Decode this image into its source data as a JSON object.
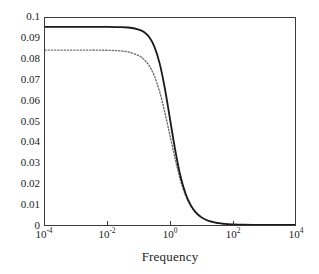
{
  "chart_data": {
    "type": "line",
    "title": "",
    "subtitle": "",
    "xlabel": "Frequency",
    "ylabel": "",
    "xscale": "log",
    "yscale": "linear",
    "xlim": [
      0.0001,
      10000
    ],
    "ylim": [
      0,
      0.1
    ],
    "grid": false,
    "legend": "none",
    "background_color": "#ffffff",
    "axis_color": "#3a3a3a",
    "x_tick_labels": [
      "10-4",
      "10-2",
      "100",
      "102",
      "104"
    ],
    "x_tick_values": [
      0.0001,
      0.01,
      1,
      100,
      10000
    ],
    "x_tick_mantissa": [
      "10",
      "10",
      "10",
      "10",
      "10"
    ],
    "x_tick_exponent": [
      "-4",
      "-2",
      "0",
      "2",
      "4"
    ],
    "y_tick_labels": [
      "0",
      "0.01",
      "0.02",
      "0.03",
      "0.04",
      "0.05",
      "0.06",
      "0.07",
      "0.08",
      "0.09",
      "0.1"
    ],
    "y_tick_values": [
      0,
      0.01,
      0.02,
      0.03,
      0.04,
      0.05,
      0.06,
      0.07,
      0.08,
      0.09,
      0.1
    ],
    "series": [
      {
        "name": "solid-curve",
        "style": "solid",
        "color": "#1a1a1a",
        "width": 1.8,
        "plateau_value": 0.0957,
        "knee_frequency": 0.2,
        "x": [
          0.0001,
          0.000215,
          0.000464,
          0.001,
          0.00215,
          0.00464,
          0.01,
          0.0215,
          0.0464,
          0.1,
          0.147,
          0.215,
          0.316,
          0.464,
          0.681,
          1.0,
          1.47,
          2.15,
          3.16,
          4.64,
          6.81,
          10.0,
          14.7,
          21.5,
          31.6,
          46.4,
          68.1,
          100.0,
          215.0,
          464.0,
          1000.0,
          2150.0,
          4640.0,
          10000.0
        ],
        "y": [
          0.0957,
          0.0957,
          0.0957,
          0.0957,
          0.0957,
          0.0957,
          0.0957,
          0.0956,
          0.0954,
          0.0944,
          0.0932,
          0.0908,
          0.0862,
          0.0782,
          0.0662,
          0.0512,
          0.0362,
          0.0238,
          0.0151,
          0.0095,
          0.006,
          0.0038,
          0.0024,
          0.0016,
          0.001,
          0.00068,
          0.00044,
          0.00029,
          0.00013,
          6e-05,
          3e-05,
          1.3e-05,
          6e-06,
          3e-06
        ]
      },
      {
        "name": "dotted-curve",
        "style": "dotted",
        "color": "#6e6e6e",
        "width": 1.4,
        "plateau_value": 0.0845,
        "knee_frequency": 0.15,
        "x": [
          0.0001,
          0.000215,
          0.000464,
          0.001,
          0.00215,
          0.00464,
          0.01,
          0.0215,
          0.0464,
          0.1,
          0.147,
          0.215,
          0.316,
          0.464,
          0.681,
          1.0,
          1.47,
          2.15,
          3.16,
          4.64,
          6.81,
          10.0,
          14.7,
          21.5,
          31.6,
          46.4,
          68.1,
          100.0,
          215.0,
          464.0,
          1000.0,
          2150.0,
          4640.0,
          10000.0
        ],
        "y": [
          0.0845,
          0.0845,
          0.0845,
          0.0845,
          0.0845,
          0.0845,
          0.0844,
          0.0842,
          0.0836,
          0.0818,
          0.08,
          0.077,
          0.072,
          0.0645,
          0.0545,
          0.0432,
          0.0318,
          0.0218,
          0.0142,
          0.0091,
          0.0058,
          0.0037,
          0.0024,
          0.0015,
          0.00098,
          0.00065,
          0.00043,
          0.00028,
          0.00013,
          6e-05,
          3e-05,
          1.3e-05,
          6e-06,
          3e-06
        ]
      }
    ]
  }
}
